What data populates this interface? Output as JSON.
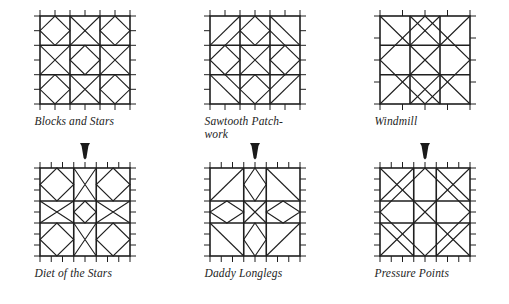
{
  "page": {
    "background_color": "#ffffff",
    "ink_color": "#1f1f1f",
    "width": 509,
    "height": 304
  },
  "figures": [
    {
      "id": "blocks-and-stars",
      "caption": "Blocks and Stars",
      "position": {
        "row": "top",
        "column": 0
      },
      "grid_divisions": 6,
      "block_divisions": 3,
      "tick_count_per_side": 7,
      "caption_align": "left"
    },
    {
      "id": "sawtooth-patchwork",
      "caption": "Sawtooth Patch-\nwork",
      "position": {
        "row": "top",
        "column": 1
      },
      "grid_divisions": 6,
      "block_divisions": 3,
      "tick_count_per_side": 7,
      "caption_align": "left"
    },
    {
      "id": "windmill",
      "caption": "Windmill",
      "position": {
        "row": "top",
        "column": 2
      },
      "grid_divisions": 4,
      "block_divisions": 3,
      "tick_count_per_side": 5,
      "caption_align": "left"
    },
    {
      "id": "diet-of-the-stars",
      "caption": "Diet of the Stars",
      "position": {
        "row": "bottom",
        "column": 0
      },
      "grid_divisions": 8,
      "block_divisions": 3,
      "tick_count_per_side": 9,
      "caption_align": "left"
    },
    {
      "id": "daddy-longlegs",
      "caption": "Daddy Longlegs",
      "position": {
        "row": "bottom",
        "column": 1
      },
      "grid_divisions": 8,
      "block_divisions": 3,
      "tick_count_per_side": 9,
      "caption_align": "left"
    },
    {
      "id": "pressure-points",
      "caption": "Pressure Points",
      "position": {
        "row": "bottom",
        "column": 2
      },
      "grid_divisions": 8,
      "block_divisions": 3,
      "tick_count_per_side": 9,
      "caption_align": "left"
    }
  ],
  "arrows": [
    {
      "id": "arrow-blocks-to-diet",
      "glyph": "down-triangle",
      "column": 0
    },
    {
      "id": "arrow-sawtooth-to-daddy",
      "glyph": "down-triangle",
      "column": 1
    },
    {
      "id": "arrow-windmill-to-pressure",
      "glyph": "down-triangle",
      "column": 2
    }
  ]
}
